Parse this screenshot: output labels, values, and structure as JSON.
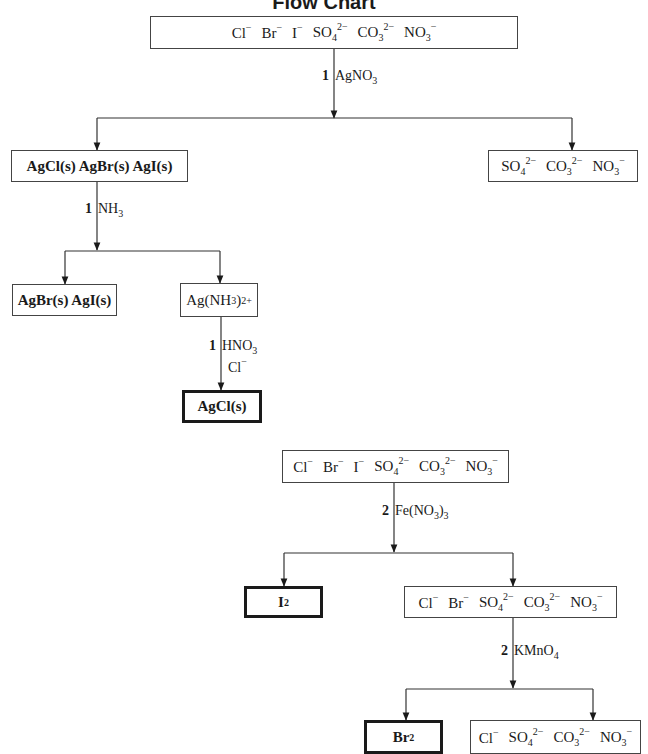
{
  "title": "Flow Chart",
  "flow1": {
    "start": {
      "ions": [
        {
          "base": "Cl",
          "sub": "",
          "sup": "−"
        },
        {
          "base": "Br",
          "sub": "",
          "sup": "−"
        },
        {
          "base": "I",
          "sub": "",
          "sup": "−"
        },
        {
          "base": "SO",
          "sub": "4",
          "sup": "2−"
        },
        {
          "base": "CO",
          "sub": "3",
          "sup": "2−"
        },
        {
          "base": "NO",
          "sub": "3",
          "sup": "−"
        }
      ]
    },
    "step1": {
      "step": "1",
      "reagent": "AgNO",
      "reagent_sub": "3"
    },
    "precipitate": "AgCl(s) AgBr(s) AgI(s)",
    "solution": {
      "ions": [
        {
          "base": "SO",
          "sub": "4",
          "sup": "2−"
        },
        {
          "base": "CO",
          "sub": "3",
          "sup": "2−"
        },
        {
          "base": "NO",
          "sub": "3",
          "sup": "−"
        }
      ]
    },
    "step2": {
      "step": "1",
      "reagent": "NH",
      "reagent_sub": "3"
    },
    "residue": "AgBr(s) AgI(s)",
    "complex": {
      "base": "Ag(NH",
      "sub": "3",
      "mid": ")",
      "sub2": "2",
      "sup": "+"
    },
    "step3": {
      "step": "1",
      "reagent": "HNO",
      "reagent_sub": "3",
      "reagent2": "Cl",
      "reagent2_sup": "−"
    },
    "final": "AgCl(s)"
  },
  "flow2": {
    "start": {
      "ions": [
        {
          "base": "Cl",
          "sub": "",
          "sup": "−"
        },
        {
          "base": "Br",
          "sub": "",
          "sup": "−"
        },
        {
          "base": "I",
          "sub": "",
          "sup": "−"
        },
        {
          "base": "SO",
          "sub": "4",
          "sup": "2−"
        },
        {
          "base": "CO",
          "sub": "3",
          "sup": "2−"
        },
        {
          "base": "NO",
          "sub": "3",
          "sup": "−"
        }
      ]
    },
    "step1": {
      "step": "2",
      "reagent": "Fe(NO",
      "reagent_sub": "3",
      "reagent_end": ")",
      "reagent_sub2": "3"
    },
    "product1": {
      "base": "I",
      "sub": "2"
    },
    "solution1": {
      "ions": [
        {
          "base": "Cl",
          "sub": "",
          "sup": "−"
        },
        {
          "base": "Br",
          "sub": "",
          "sup": "−"
        },
        {
          "base": "SO",
          "sub": "4",
          "sup": "2−"
        },
        {
          "base": "CO",
          "sub": "3",
          "sup": "2−"
        },
        {
          "base": "NO",
          "sub": "3",
          "sup": "−"
        }
      ]
    },
    "step2": {
      "step": "2",
      "reagent": "KMnO",
      "reagent_sub": "4"
    },
    "product2": {
      "base": "Br",
      "sub": "2"
    },
    "solution2": {
      "ions": [
        {
          "base": "Cl",
          "sub": "",
          "sup": "−"
        },
        {
          "base": "SO",
          "sub": "4",
          "sup": "2−"
        },
        {
          "base": "CO",
          "sub": "3",
          "sup": "2−"
        },
        {
          "base": "NO",
          "sub": "3",
          "sup": "−"
        }
      ]
    }
  }
}
